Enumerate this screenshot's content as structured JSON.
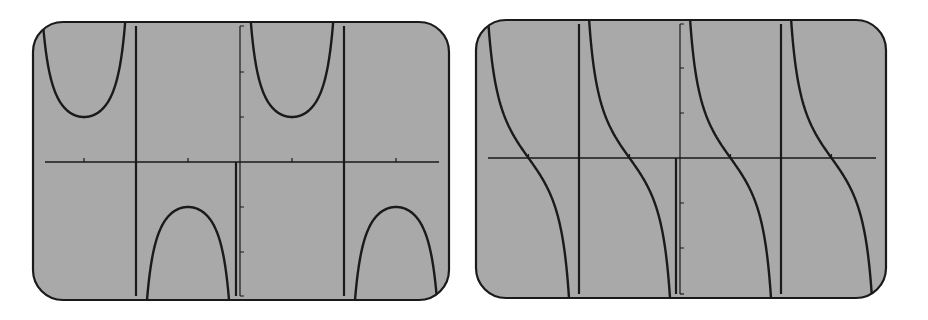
{
  "colors": {
    "page_background": "#ffffff",
    "screen_background": "#a9a9a9",
    "ink": "#1a1a1a"
  },
  "chart_data": [
    {
      "type": "line",
      "title": "",
      "function": "y = csc(x)",
      "xlabel": "",
      "ylabel": "",
      "tick_labels_shown": false,
      "grid": false,
      "legend": null,
      "xlim": [
        -2.0,
        2.0
      ],
      "xlim_units": "pi",
      "ylim": [
        -3.1,
        3.1
      ],
      "x_ticks_pi": [
        -1.5,
        -0.5,
        0.5,
        1.5
      ],
      "y_ticks": [
        -2,
        -1,
        1,
        2
      ],
      "asymptotes_pi": [
        -1,
        0,
        1
      ],
      "local_extrema": [
        {
          "x_pi": -1.5,
          "y": 1
        },
        {
          "x_pi": -0.5,
          "y": -1
        },
        {
          "x_pi": 0.5,
          "y": 1
        },
        {
          "x_pi": 1.5,
          "y": -1
        }
      ],
      "frame": {
        "x": 33,
        "y": 22,
        "width": 416,
        "height": 278,
        "radius": 30
      },
      "origin_px": {
        "x": 240,
        "y": 162
      },
      "px_per_pi": 104,
      "px_per_unit_y": 45
    },
    {
      "type": "line",
      "title": "",
      "function": "y = cot(x)",
      "xlabel": "",
      "ylabel": "",
      "tick_labels_shown": false,
      "grid": false,
      "legend": null,
      "xlim": [
        -2.0,
        2.0
      ],
      "xlim_units": "pi",
      "ylim": [
        -3.1,
        3.1
      ],
      "x_ticks_pi": [
        -1.5,
        -1,
        -0.5,
        0.5,
        1,
        1.5
      ],
      "y_ticks": [
        -2,
        -1,
        1,
        2
      ],
      "asymptotes_pi": [
        -1,
        0,
        1
      ],
      "zero_crossings_pi": [
        -1.5,
        -0.5,
        0.5,
        1.5
      ],
      "frame": {
        "x": 476,
        "y": 20,
        "width": 410,
        "height": 278,
        "radius": 30
      },
      "origin_px": {
        "x": 680,
        "y": 158
      },
      "px_per_pi": 101,
      "px_per_unit_y": 45
    }
  ]
}
